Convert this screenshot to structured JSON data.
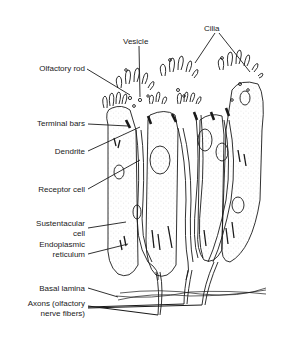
{
  "diagram": {
    "labels": {
      "cilia": "Cilia",
      "vesicle": "Vesicle",
      "olfactory_rod": "Olfactory rod",
      "terminal_bars": "Terminal bars",
      "dendrite": "Dendrite",
      "receptor_cell": "Receptor cell",
      "sustentacular_cell_line1": "Sustentacular",
      "sustentacular_cell_line2": "cell",
      "endoplasmic_reticulum_line1": "Endoplasmic",
      "endoplasmic_reticulum_line2": "reticulum",
      "basal_lamina": "Basal lamina",
      "axons_line1": "Axons (olfactory",
      "axons_line2": "nerve fibers)"
    },
    "colors": {
      "ink": "#1a1a1a",
      "background": "#ffffff",
      "stipple": "#9a9a9a"
    }
  }
}
